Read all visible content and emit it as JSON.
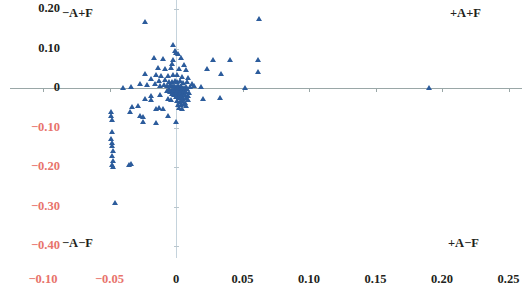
{
  "chart_data": {
    "type": "scatter",
    "title": "",
    "xlabel": "",
    "ylabel": "",
    "xlim": [
      -0.125,
      0.26
    ],
    "ylim": [
      -0.43,
      0.225
    ],
    "grid": false,
    "legend": null,
    "marker": "triangle",
    "marker_color": "#2c5c9c",
    "axis_color": "#9aa7a7",
    "negative_label_color": "#e8736b",
    "positive_label_color": "#231f20",
    "x_ticks": [
      -0.1,
      -0.05,
      0,
      0.05,
      0.1,
      0.15,
      0.2,
      0.25
    ],
    "x_tick_labels": [
      "-0.10",
      "-0.05",
      "0",
      "0.05",
      "0.10",
      "0.15",
      "0.20",
      "0.25"
    ],
    "y_ticks": [
      0.2,
      0.1,
      0,
      -0.1,
      -0.2,
      -0.3,
      -0.4
    ],
    "y_tick_labels": [
      "0.20",
      "0.10",
      "0",
      "-0.10",
      "-0.20",
      "-0.30",
      "-0.40"
    ],
    "quadrant_labels": [
      {
        "id": "top-left",
        "text": "−A+F"
      },
      {
        "id": "top-right",
        "text": "+A+F"
      },
      {
        "id": "bottom-left",
        "text": "−A−F"
      },
      {
        "id": "bottom-right",
        "text": "+A−F"
      }
    ],
    "points": [
      [
        -0.0235,
        0.168
      ],
      [
        0.0625,
        0.175
      ],
      [
        -0.0025,
        0.108
      ],
      [
        -0.0005,
        0.093
      ],
      [
        0.0,
        0.088
      ],
      [
        0.0015,
        0.086
      ],
      [
        -0.0165,
        0.075
      ],
      [
        -0.0095,
        0.073
      ],
      [
        -0.002,
        0.072
      ],
      [
        0.0035,
        0.075
      ],
      [
        0.0275,
        0.072
      ],
      [
        0.0405,
        0.07
      ],
      [
        0.0615,
        0.072
      ],
      [
        -0.003,
        0.06
      ],
      [
        0.006,
        0.058
      ],
      [
        -0.0135,
        0.05
      ],
      [
        -0.008,
        0.048
      ],
      [
        -0.004,
        0.05
      ],
      [
        0.002,
        0.048
      ],
      [
        0.0075,
        0.045
      ],
      [
        0.023,
        0.047
      ],
      [
        0.034,
        0.035
      ],
      [
        0.062,
        0.04
      ],
      [
        -0.023,
        0.035
      ],
      [
        -0.015,
        0.033
      ],
      [
        -0.011,
        0.03
      ],
      [
        -0.006,
        0.03
      ],
      [
        -0.002,
        0.032
      ],
      [
        0.0005,
        0.033
      ],
      [
        0.0045,
        0.028
      ],
      [
        0.009,
        0.026
      ],
      [
        -0.0185,
        0.022
      ],
      [
        -0.0125,
        0.018
      ],
      [
        -0.0085,
        0.02
      ],
      [
        -0.005,
        0.016
      ],
      [
        -0.003,
        0.014
      ],
      [
        -0.001,
        0.018
      ],
      [
        0.001,
        0.015
      ],
      [
        0.003,
        0.017
      ],
      [
        0.0055,
        0.012
      ],
      [
        0.0085,
        0.014
      ],
      [
        0.012,
        0.01
      ],
      [
        -0.027,
        0.01
      ],
      [
        -0.022,
        0.008
      ],
      [
        -0.016,
        0.009
      ],
      [
        -0.012,
        0.006
      ],
      [
        -0.009,
        0.008
      ],
      [
        -0.0065,
        0.005
      ],
      [
        -0.0045,
        0.007
      ],
      [
        -0.0028,
        0.004
      ],
      [
        -0.0012,
        0.006
      ],
      [
        0.0,
        0.003
      ],
      [
        0.0012,
        0.005
      ],
      [
        0.0025,
        0.002
      ],
      [
        0.004,
        0.004
      ],
      [
        0.0058,
        0.001
      ],
      [
        0.0078,
        0.003
      ],
      [
        0.0105,
        0.002
      ],
      [
        0.0135,
        0.004
      ],
      [
        0.0185,
        0.002
      ],
      [
        -0.034,
        0.002
      ],
      [
        -0.0395,
        0.001
      ],
      [
        0.052,
        0.001
      ],
      [
        0.19,
        0.001
      ],
      [
        -0.0052,
        -0.002
      ],
      [
        -0.0032,
        -0.004
      ],
      [
        -0.0015,
        -0.002
      ],
      [
        0.0,
        -0.005
      ],
      [
        0.0014,
        -0.003
      ],
      [
        0.0028,
        -0.006
      ],
      [
        0.0042,
        -0.002
      ],
      [
        0.006,
        -0.005
      ],
      [
        0.0082,
        -0.003
      ],
      [
        -0.007,
        -0.007
      ],
      [
        -0.0045,
        -0.009
      ],
      [
        -0.0025,
        -0.008
      ],
      [
        -0.0008,
        -0.011
      ],
      [
        0.0008,
        -0.009
      ],
      [
        0.0022,
        -0.012
      ],
      [
        0.0038,
        -0.01
      ],
      [
        0.0055,
        -0.013
      ],
      [
        0.0072,
        -0.009
      ],
      [
        0.0095,
        -0.012
      ],
      [
        -0.003,
        -0.016
      ],
      [
        -0.0012,
        -0.018
      ],
      [
        0.0002,
        -0.015
      ],
      [
        0.0018,
        -0.019
      ],
      [
        0.0032,
        -0.016
      ],
      [
        0.0048,
        -0.02
      ],
      [
        0.0065,
        -0.017
      ],
      [
        0.0088,
        -0.021
      ],
      [
        -0.012,
        -0.018
      ],
      [
        -0.0185,
        -0.02
      ],
      [
        0.0002,
        -0.024
      ],
      [
        0.002,
        -0.026
      ],
      [
        0.0038,
        -0.023
      ],
      [
        0.0055,
        -0.028
      ],
      [
        0.0072,
        -0.025
      ],
      [
        0.009,
        -0.03
      ],
      [
        -0.006,
        -0.028
      ],
      [
        -0.004,
        -0.031
      ],
      [
        0.001,
        -0.034
      ],
      [
        0.003,
        -0.036
      ],
      [
        0.0048,
        -0.033
      ],
      [
        0.0068,
        -0.038
      ],
      [
        0.02,
        -0.028
      ],
      [
        0.033,
        -0.026
      ],
      [
        -0.0185,
        -0.03
      ],
      [
        -0.0235,
        -0.028
      ],
      [
        0.0015,
        -0.042
      ],
      [
        0.0038,
        -0.044
      ],
      [
        0.0058,
        -0.041
      ],
      [
        0.0078,
        -0.046
      ],
      [
        0.0025,
        -0.05
      ],
      [
        0.0048,
        -0.052
      ],
      [
        -0.033,
        -0.048
      ],
      [
        -0.0285,
        -0.046
      ],
      [
        -0.015,
        -0.052
      ],
      [
        -0.0125,
        -0.05
      ],
      [
        -0.0095,
        -0.054
      ],
      [
        -0.0345,
        -0.062
      ],
      [
        -0.049,
        -0.06
      ],
      [
        -0.0485,
        -0.07
      ],
      [
        -0.027,
        -0.072
      ],
      [
        -0.025,
        -0.074
      ],
      [
        -0.006,
        -0.07
      ],
      [
        -0.015,
        -0.088
      ],
      [
        -0.0245,
        -0.085
      ],
      [
        -0.048,
        -0.082
      ],
      [
        0.0002,
        -0.086
      ],
      [
        -0.048,
        -0.112
      ],
      [
        -0.0485,
        -0.128
      ],
      [
        -0.0478,
        -0.138
      ],
      [
        -0.0482,
        -0.148
      ],
      [
        -0.0475,
        -0.16
      ],
      [
        -0.048,
        -0.172
      ],
      [
        -0.047,
        -0.185
      ],
      [
        -0.0355,
        -0.195
      ],
      [
        -0.0335,
        -0.193
      ],
      [
        -0.0478,
        -0.196
      ],
      [
        -0.047,
        -0.2
      ],
      [
        -0.0455,
        -0.29
      ]
    ]
  }
}
